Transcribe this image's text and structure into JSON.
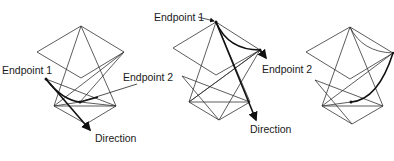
{
  "figures": [
    {
      "id": "figure-1",
      "labels": {
        "endpoint1": "Endpoint 1",
        "endpoint2": "Endpoint 2",
        "direction": "Direction"
      }
    },
    {
      "id": "figure-2",
      "labels": {
        "endpoint1": "Endpoint 1",
        "endpoint2": "Endpoint 2",
        "direction": "Direction"
      }
    },
    {
      "id": "figure-3",
      "labels": {}
    }
  ],
  "colors": {
    "line": "#333333",
    "text": "#1a1a1a",
    "background": "#ffffff"
  }
}
